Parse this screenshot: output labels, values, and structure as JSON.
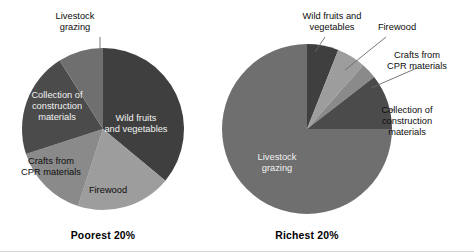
{
  "figure": {
    "background": "#ffffff",
    "width": 474,
    "height": 252
  },
  "chart_data": [
    {
      "type": "pie",
      "title": "Poorest 20%",
      "caption": "Poorest 20%",
      "legend": "none",
      "categories": [
        "Wild fruits and vegetables",
        "Firewood",
        "Crafts from CPR materials",
        "Collection of construction materials",
        "Livestock grazing"
      ],
      "values": [
        36,
        19,
        15,
        21,
        9
      ],
      "colors": [
        "#3f3f3f",
        "#9d9d9d",
        "#8a8a8a",
        "#4b4b4b",
        "#6f6f6f"
      ],
      "start_angle_deg": 0,
      "direction": "clockwise",
      "center": {
        "x": 103,
        "y": 129
      },
      "radius": 81,
      "labels": [
        {
          "text": "Wild fruits",
          "x": 136,
          "y": 121,
          "style": "light"
        },
        {
          "text": "and vegetables",
          "x": 136,
          "y": 132,
          "style": "light"
        },
        {
          "text": "Firewood",
          "x": 108,
          "y": 193,
          "style": "dark"
        },
        {
          "text": "Crafts from",
          "x": 51,
          "y": 164,
          "style": "dark"
        },
        {
          "text": "CPR materials",
          "x": 51,
          "y": 175,
          "style": "dark"
        },
        {
          "text": "Collection of",
          "x": 57,
          "y": 98,
          "style": "light"
        },
        {
          "text": "construction",
          "x": 57,
          "y": 109,
          "style": "light"
        },
        {
          "text": "materials",
          "x": 57,
          "y": 120,
          "style": "light"
        }
      ],
      "callouts": [
        {
          "text_lines": [
            "Livestock",
            "grazing"
          ],
          "text_x": 75,
          "text_y": 19,
          "anchor": "middle",
          "leader": "M 100 37 L 100 49"
        }
      ]
    },
    {
      "type": "pie",
      "title": "Richest 20%",
      "caption": "Richest 20%",
      "legend": "none",
      "categories": [
        "Wild fruits and vegetables",
        "Firewood",
        "Crafts from CPR materials",
        "Collection of construction materials",
        "Livestock grazing"
      ],
      "values": [
        6,
        5.5,
        3,
        10.5,
        75
      ],
      "colors": [
        "#3f3f3f",
        "#9d9d9d",
        "#8a8a8a",
        "#4b4b4b",
        "#6f6f6f"
      ],
      "start_angle_deg": 0,
      "direction": "clockwise",
      "center": {
        "x": 307,
        "y": 129
      },
      "radius": 85,
      "labels": [
        {
          "text": "Livestock",
          "x": 277,
          "y": 160,
          "style": "light"
        },
        {
          "text": "grazing",
          "x": 277,
          "y": 171,
          "style": "light"
        }
      ],
      "callouts": [
        {
          "text_lines": [
            "Wild fruits and",
            "vegetables"
          ],
          "text_x": 332,
          "text_y": 19,
          "anchor": "middle",
          "leader": "M 325 37 L 315 52"
        },
        {
          "text_lines": [
            "Firewood"
          ],
          "text_x": 397,
          "text_y": 30,
          "anchor": "middle",
          "leader": "M 386 37 L 345 70"
        },
        {
          "text_lines": [
            "Crafts from",
            "CPR materials"
          ],
          "text_x": 417,
          "text_y": 58,
          "anchor": "middle",
          "leader": "M 417 68 L 371 88"
        },
        {
          "text_lines": [
            "Collection of",
            "construction",
            "materials"
          ],
          "text_x": 407,
          "text_y": 113,
          "anchor": "middle",
          "leader": "M 383 110 L 395 110"
        }
      ]
    }
  ],
  "captions": {
    "left": {
      "text": "Poorest 20%",
      "x": 103,
      "y": 239
    },
    "right": {
      "text": "Richest 20%",
      "x": 307,
      "y": 239
    }
  }
}
